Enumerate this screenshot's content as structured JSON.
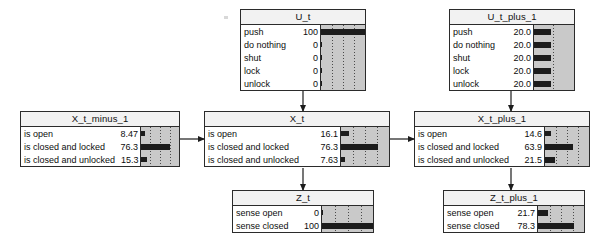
{
  "diagram": {
    "type": "dynamic-bayesian-network-belief-view",
    "background_color": "#ffffff",
    "node_border_color": "#2b2b2b",
    "title_background_color": "#f2f2f2",
    "bar_panel_background_color": "#c9c9c9",
    "bar_color": "#1c1c1c",
    "gridline_color": "#4a4a4a"
  },
  "nodes": [
    {
      "id": "u_t",
      "title": "U_t",
      "kind": "action",
      "value_axis_max": 100,
      "gridline_count": 3,
      "rows": [
        {
          "label": "push",
          "value": "100",
          "percent": 100
        },
        {
          "label": "do nothing",
          "value": "0",
          "percent": 0
        },
        {
          "label": "shut",
          "value": "0",
          "percent": 0
        },
        {
          "label": "lock",
          "value": "0",
          "percent": 0
        },
        {
          "label": "unlock",
          "value": "0",
          "percent": 0
        }
      ]
    },
    {
      "id": "u_t_plus_1",
      "title": "U_t_plus_1",
      "kind": "action",
      "value_axis_max": 100,
      "gridline_count": 1,
      "rows": [
        {
          "label": "push",
          "value": "20.0",
          "percent": 20
        },
        {
          "label": "do nothing",
          "value": "20.0",
          "percent": 20
        },
        {
          "label": "shut",
          "value": "20.0",
          "percent": 20
        },
        {
          "label": "lock",
          "value": "20.0",
          "percent": 20
        },
        {
          "label": "unlock",
          "value": "20.0",
          "percent": 20
        }
      ]
    },
    {
      "id": "x_t_minus_1",
      "title": "X_t_minus_1",
      "kind": "state",
      "value_axis_max": 100,
      "gridline_count": 3,
      "rows": [
        {
          "label": "is open",
          "value": "8.47",
          "percent": 8.47
        },
        {
          "label": "is closed and locked",
          "value": "76.3",
          "percent": 76.3
        },
        {
          "label": "is closed and unlocked",
          "value": "15.3",
          "percent": 15.3
        }
      ]
    },
    {
      "id": "x_t",
      "title": "X_t",
      "kind": "state",
      "value_axis_max": 100,
      "gridline_count": 3,
      "rows": [
        {
          "label": "is open",
          "value": "16.1",
          "percent": 16.1
        },
        {
          "label": "is closed and locked",
          "value": "76.3",
          "percent": 76.3
        },
        {
          "label": "is closed and unlocked",
          "value": "7.63",
          "percent": 7.63
        }
      ]
    },
    {
      "id": "x_t_plus_1",
      "title": "X_t_plus_1",
      "kind": "state",
      "value_axis_max": 100,
      "gridline_count": 3,
      "rows": [
        {
          "label": "is open",
          "value": "14.6",
          "percent": 14.6
        },
        {
          "label": "is closed and locked",
          "value": "63.9",
          "percent": 63.9
        },
        {
          "label": "is closed and unlocked",
          "value": "21.5",
          "percent": 21.5
        }
      ]
    },
    {
      "id": "z_t",
      "title": "Z_t",
      "kind": "observation",
      "value_axis_max": 100,
      "gridline_count": 3,
      "rows": [
        {
          "label": "sense open",
          "value": "0",
          "percent": 0
        },
        {
          "label": "sense closed",
          "value": "100",
          "percent": 100
        }
      ]
    },
    {
      "id": "z_t_plus_1",
      "title": "Z_t_plus_1",
      "kind": "observation",
      "value_axis_max": 100,
      "gridline_count": 3,
      "rows": [
        {
          "label": "sense open",
          "value": "21.7",
          "percent": 21.7
        },
        {
          "label": "sense closed",
          "value": "78.3",
          "percent": 78.3
        }
      ]
    }
  ],
  "edges": [
    {
      "from": "u_t",
      "to": "x_t",
      "direction": "down"
    },
    {
      "from": "u_t_plus_1",
      "to": "x_t_plus_1",
      "direction": "down"
    },
    {
      "from": "x_t_minus_1",
      "to": "x_t",
      "direction": "right"
    },
    {
      "from": "x_t",
      "to": "x_t_plus_1",
      "direction": "right"
    },
    {
      "from": "x_t",
      "to": "z_t",
      "direction": "down"
    },
    {
      "from": "x_t_plus_1",
      "to": "z_t_plus_1",
      "direction": "down"
    }
  ]
}
